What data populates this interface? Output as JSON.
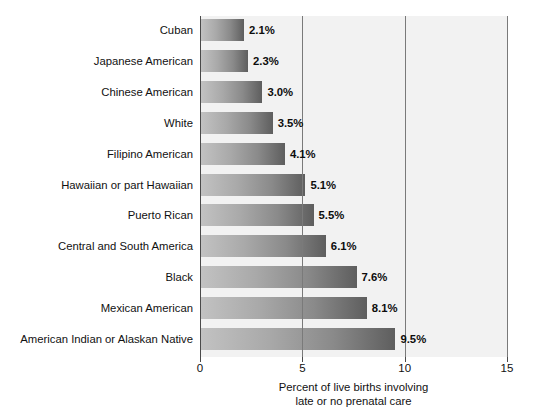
{
  "chart_data": {
    "type": "bar",
    "orientation": "horizontal",
    "title": "",
    "subtitle": "",
    "xlabel_line1": "Percent of live births involving",
    "xlabel_line2": "late or no prenatal care",
    "ylabel": "",
    "xlim": [
      0,
      15
    ],
    "xticks": [
      "0",
      "5",
      "10",
      "15"
    ],
    "xtick_values": [
      0,
      5,
      10,
      15
    ],
    "grid": "vertical",
    "legend": "none",
    "categories": [
      "Cuban",
      "Japanese American",
      "Chinese American",
      "White",
      "Filipino American",
      "Hawaiian or part Hawaiian",
      "Puerto Rican",
      "Central and South America",
      "Black",
      "Mexican American",
      "American Indian or Alaskan Native"
    ],
    "values": [
      2.1,
      2.3,
      3.0,
      3.5,
      4.1,
      5.1,
      5.5,
      6.1,
      7.6,
      8.1,
      9.5
    ],
    "value_labels": [
      "2.1%",
      "2.3%",
      "3.0%",
      "3.5%",
      "4.1%",
      "5.1%",
      "5.5%",
      "6.1%",
      "7.6%",
      "8.1%",
      "9.5%"
    ],
    "colors": {
      "bar_gradient_start": "#c2c2c2",
      "bar_gradient_end": "#5e5e5e",
      "plot_background": "#f2f2f2",
      "page_background": "#ffffff",
      "gridline": "#7a7a7a",
      "axis": "#4a4a4a",
      "text": "#111111"
    }
  }
}
